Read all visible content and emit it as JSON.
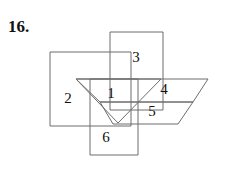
{
  "problem": {
    "number": "16."
  },
  "figure": {
    "stroke_color": "#6d6d6d",
    "background_color": "#ffffff",
    "label_color": "#111111",
    "shapes": [
      {
        "name": "left-square",
        "type": "square",
        "points": "50,52 131,52 131,126 50,126"
      },
      {
        "name": "top-square",
        "type": "square",
        "points": "110,32 163,32 163,110 110,110"
      },
      {
        "name": "bottom-square",
        "type": "square",
        "points": "90,79 138,79 138,155 90,155"
      },
      {
        "name": "triangle",
        "type": "triangle",
        "points": "76,79 161,79 118,123"
      },
      {
        "name": "upper-parallelogram",
        "type": "parallelogram",
        "points": "76,79 208,79 193,102 100,102"
      },
      {
        "name": "lower-parallelogram",
        "type": "parallelogram",
        "points": "100,102 193,102 178,124 113,124"
      }
    ],
    "region_labels": [
      {
        "id": "1",
        "text": "1",
        "x": 111,
        "y": 95
      },
      {
        "id": "2",
        "text": "2",
        "x": 68,
        "y": 100
      },
      {
        "id": "3",
        "text": "3",
        "x": 136,
        "y": 59
      },
      {
        "id": "4",
        "text": "4",
        "x": 164,
        "y": 91
      },
      {
        "id": "5",
        "text": "5",
        "x": 152,
        "y": 113
      },
      {
        "id": "6",
        "text": "6",
        "x": 106,
        "y": 139
      }
    ]
  }
}
